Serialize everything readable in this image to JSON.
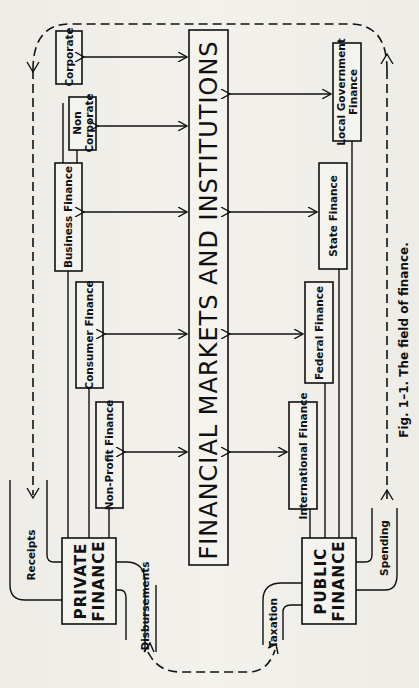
{
  "figure": {
    "caption": "Fig. 1–1. The field of finance.",
    "center_label": "FINANCIAL MARKETS AND INSTITUTIONS"
  },
  "private_side": {
    "hub_line1": "PRIVATE",
    "hub_line2": "FINANCE",
    "boxes": [
      {
        "label": "Corporate"
      },
      {
        "label1": "Non",
        "label2": "Corporate"
      },
      {
        "label": "Business Finance"
      },
      {
        "label": "Consumer Finance"
      },
      {
        "label": "Non-Profit Finance"
      }
    ],
    "flows": {
      "in": "Receipts",
      "out": "Disbursements"
    }
  },
  "public_side": {
    "hub_line1": "PUBLIC",
    "hub_line2": "FINANCE",
    "boxes": [
      {
        "label1": "Local Government",
        "label2": "Finance"
      },
      {
        "label": "State Finance"
      },
      {
        "label": "Federal Finance"
      },
      {
        "label": "International Finance"
      }
    ],
    "flows": {
      "in": "Taxation",
      "out": "Spending"
    }
  },
  "colors": {
    "ink": "#111111",
    "paper": "#f1efe9"
  }
}
